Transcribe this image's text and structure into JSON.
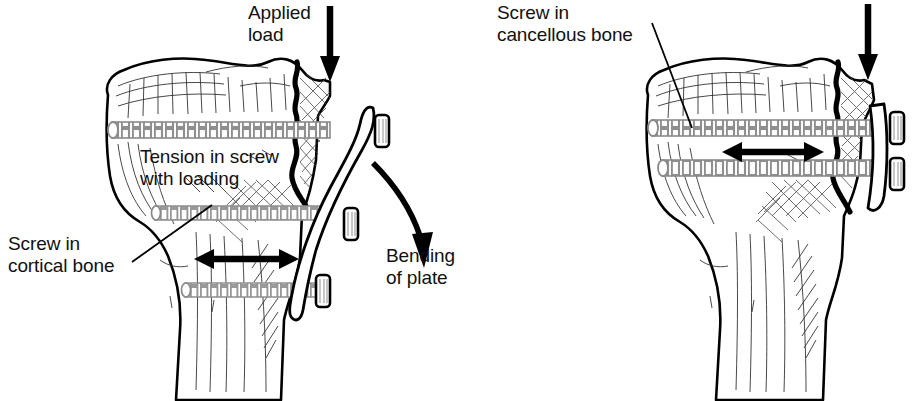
{
  "figure": {
    "background_color": "#ffffff",
    "ink_color": "#000000",
    "screw_color": "#8a8a8a",
    "width": 912,
    "height": 401
  },
  "labels": {
    "applied_load": "Applied\nload",
    "tension_in_screw": "Tension in screw\nwith loading",
    "screw_in_cortical_bone": "Screw in\ncortical bone",
    "bending_of_plate": "Bending\nof plate",
    "screw_in_cancellous_bone": "Screw in\ncancellous bone"
  },
  "panels": [
    {
      "id": "left-panel",
      "name": "plate-and-screw-fixation",
      "load_arrow": {
        "type": "straight-down-arrow",
        "x": 330,
        "y_top": 6,
        "y_bottom": 80
      },
      "bending_arrow": {
        "type": "curved-arrow",
        "direction": "clockwise-down"
      },
      "tension_arrow": {
        "type": "double-headed-arrow",
        "orientation": "horizontal",
        "x_left": 197,
        "x_right": 295,
        "y": 259
      },
      "screws": [
        {
          "index": 1,
          "region": "cancellous",
          "y": 130,
          "x_start": 112,
          "x_end": 330
        },
        {
          "index": 2,
          "region": "cortical",
          "y": 213,
          "x_start": 155,
          "x_end": 325
        },
        {
          "index": 3,
          "region": "cortical",
          "y": 290,
          "x_start": 185,
          "x_end": 322
        }
      ],
      "plate": {
        "screw_holes": 3,
        "shape": "bent-buttress-plate"
      },
      "fracture_line": "oblique-lateral"
    },
    {
      "id": "right-panel",
      "name": "cancellous-screw-fixation",
      "load_arrow": {
        "type": "straight-down-arrow",
        "x": 868,
        "y_top": 4,
        "y_bottom": 78
      },
      "tension_arrow": {
        "type": "double-headed-arrow",
        "orientation": "horizontal",
        "x_left": 723,
        "x_right": 818,
        "y": 152
      },
      "screws": [
        {
          "index": 1,
          "region": "cancellous",
          "y": 128,
          "x_start": 652,
          "x_end": 880
        },
        {
          "index": 2,
          "region": "cancellous",
          "y": 168,
          "x_start": 662,
          "x_end": 878
        }
      ],
      "plate": {
        "screw_holes": 2,
        "shape": "partial-plate-edge"
      },
      "fracture_line": "oblique-lateral"
    }
  ]
}
